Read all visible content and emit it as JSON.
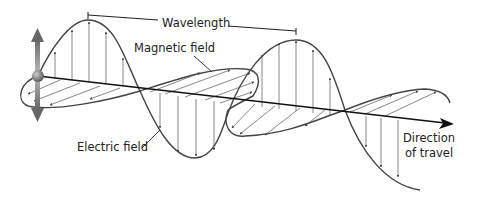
{
  "diagram": {
    "labels": {
      "wavelength": "Wavelength",
      "magnetic_field": "Magnetic field",
      "electric_field": "Electric field",
      "direction_line1": "Direction",
      "direction_line2": "of travel"
    },
    "icons": {
      "oscillating_charge": "sphere-with-vertical-double-arrow",
      "direction_arrow": "arrowhead-right"
    },
    "colors": {
      "line": "#444444",
      "axis": "#111111",
      "text": "#222222",
      "charge": "#777777"
    }
  }
}
